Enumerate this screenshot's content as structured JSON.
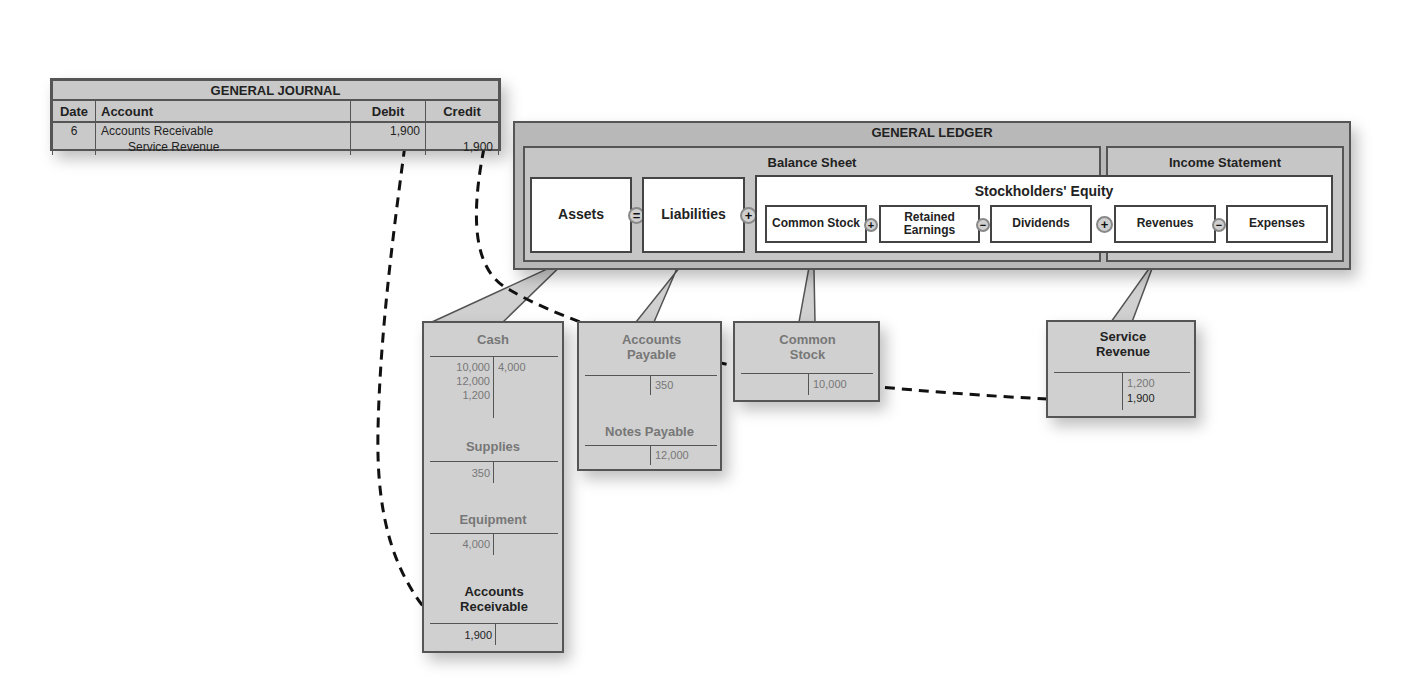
{
  "journal": {
    "title": "GENERAL JOURNAL",
    "columns": [
      "Date",
      "Account",
      "Debit",
      "Credit"
    ],
    "rows": [
      {
        "date": "6",
        "account": "Accounts Receivable",
        "debit": "1,900",
        "credit": ""
      },
      {
        "date": "",
        "account": "Service Revenue",
        "debit": "",
        "credit": "1,900"
      }
    ]
  },
  "ledger": {
    "title": "GENERAL LEDGER",
    "balance_sheet": {
      "title": "Balance Sheet",
      "assets": "Assets",
      "liabilities": "Liabilities",
      "equity": {
        "title": "Stockholders' Equity",
        "common_stock": "Common Stock",
        "retained_earnings": "Retained Earnings",
        "dividends": "Dividends"
      }
    },
    "income_statement": {
      "title": "Income Statement",
      "revenues": "Revenues",
      "expenses": "Expenses"
    },
    "operators": {
      "equals": "=",
      "plus": "+",
      "minus": "−"
    }
  },
  "t_accounts": {
    "assets": {
      "cash": {
        "name": "Cash",
        "debits": [
          "10,000",
          "12,000",
          "1,200"
        ],
        "credits": [
          "4,000"
        ]
      },
      "supplies": {
        "name": "Supplies",
        "debits": [
          "350"
        ],
        "credits": []
      },
      "equipment": {
        "name": "Equipment",
        "debits": [
          "4,000"
        ],
        "credits": []
      },
      "accounts_receivable": {
        "name": "Accounts Receivable",
        "debits": [
          "1,900"
        ],
        "credits": []
      }
    },
    "liabilities": {
      "accounts_payable": {
        "name": "Accounts Payable",
        "debits": [],
        "credits": [
          "350"
        ]
      },
      "notes_payable": {
        "name": "Notes Payable",
        "debits": [],
        "credits": [
          "12,000"
        ]
      }
    },
    "equity": {
      "common_stock": {
        "name": "Common Stock",
        "debits": [],
        "credits": [
          "10,000"
        ]
      }
    },
    "revenue": {
      "service_revenue": {
        "name": "Service Revenue",
        "debits": [],
        "credits": [
          "1,200",
          "1,900"
        ]
      }
    }
  },
  "colors": {
    "panel_gray": "#b8b8b8",
    "border": "#555555",
    "arrow": "#111111"
  }
}
